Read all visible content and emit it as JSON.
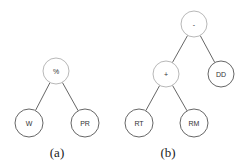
{
  "diagrams": [
    {
      "id": "a",
      "caption": "(a)",
      "caption_pos": [
        57,
        157
      ],
      "nodes": [
        {
          "key": "root",
          "label": "%",
          "x": 56,
          "y": 71,
          "r": 13,
          "style": "light"
        },
        {
          "key": "left",
          "label": "W",
          "x": 29,
          "y": 123,
          "r": 14,
          "style": "dark"
        },
        {
          "key": "right",
          "label": "PR",
          "x": 85,
          "y": 123,
          "r": 14,
          "style": "dark"
        }
      ],
      "edges": [
        [
          "root",
          "left"
        ],
        [
          "root",
          "right"
        ]
      ]
    },
    {
      "id": "b",
      "caption": "(b)",
      "caption_pos": [
        168,
        157
      ],
      "nodes": [
        {
          "key": "root",
          "label": "-",
          "x": 194,
          "y": 24,
          "r": 13,
          "style": "light"
        },
        {
          "key": "plus",
          "label": "+",
          "x": 166,
          "y": 74,
          "r": 13,
          "style": "light"
        },
        {
          "key": "dd",
          "label": "DD",
          "x": 221,
          "y": 74,
          "r": 13,
          "style": "dark"
        },
        {
          "key": "rt",
          "label": "RT",
          "x": 139,
          "y": 123,
          "r": 14,
          "style": "dark"
        },
        {
          "key": "rm",
          "label": "RM",
          "x": 194,
          "y": 123,
          "r": 14,
          "style": "dark"
        }
      ],
      "edges": [
        [
          "root",
          "plus"
        ],
        [
          "root",
          "dd"
        ],
        [
          "plus",
          "rt"
        ],
        [
          "plus",
          "rm"
        ]
      ]
    }
  ],
  "colors": {
    "light_stroke": "#b0b0b0",
    "dark_stroke": "#555555",
    "edge": "#555555"
  }
}
